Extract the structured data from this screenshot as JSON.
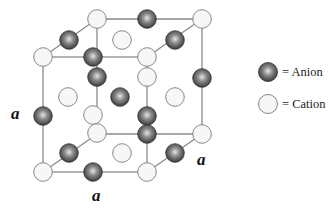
{
  "figure": {
    "edge_labels": {
      "left": "a",
      "bottom": "a",
      "right": "a"
    }
  },
  "legend": {
    "items": [
      {
        "symbol": "dark-sphere",
        "label": "= Anion"
      },
      {
        "symbol": "light-sphere",
        "label": "= Cation"
      }
    ]
  },
  "colors": {
    "edge": "#888888",
    "anion_dark": "#3a3a3a",
    "anion_light": "#d9d9d9",
    "cation_fill": "#f7f7f7",
    "cation_stroke": "#7a7a7a"
  },
  "atoms": [
    {
      "type": "cation",
      "x": 97,
      "y": 19
    },
    {
      "type": "anion",
      "x": 147,
      "y": 19
    },
    {
      "type": "cation",
      "x": 202,
      "y": 19
    },
    {
      "type": "anion",
      "x": 69,
      "y": 40
    },
    {
      "type": "cation",
      "x": 122,
      "y": 40
    },
    {
      "type": "anion",
      "x": 175,
      "y": 40
    },
    {
      "type": "cation",
      "x": 43,
      "y": 57
    },
    {
      "type": "anion",
      "x": 93,
      "y": 57
    },
    {
      "type": "cation",
      "x": 147,
      "y": 57
    },
    {
      "type": "anion",
      "x": 97,
      "y": 77
    },
    {
      "type": "cation",
      "x": 147,
      "y": 77
    },
    {
      "type": "anion",
      "x": 202,
      "y": 78
    },
    {
      "type": "cation",
      "x": 68,
      "y": 97
    },
    {
      "type": "anion",
      "x": 120,
      "y": 97
    },
    {
      "type": "cation",
      "x": 175,
      "y": 97
    },
    {
      "type": "anion",
      "x": 43,
      "y": 116
    },
    {
      "type": "cation",
      "x": 93,
      "y": 115
    },
    {
      "type": "anion",
      "x": 147,
      "y": 116
    },
    {
      "type": "cation",
      "x": 97,
      "y": 133
    },
    {
      "type": "anion",
      "x": 147,
      "y": 134
    },
    {
      "type": "cation",
      "x": 202,
      "y": 134
    },
    {
      "type": "anion",
      "x": 69,
      "y": 153
    },
    {
      "type": "cation",
      "x": 122,
      "y": 153
    },
    {
      "type": "anion",
      "x": 175,
      "y": 153
    },
    {
      "type": "cation",
      "x": 43,
      "y": 172
    },
    {
      "type": "anion",
      "x": 93,
      "y": 172
    },
    {
      "type": "cation",
      "x": 147,
      "y": 172
    }
  ]
}
